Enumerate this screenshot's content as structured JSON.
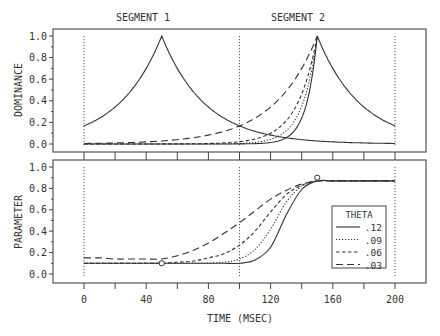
{
  "chart_data": [
    {
      "type": "line",
      "panel": "top",
      "title": "",
      "segment_labels": [
        "SEGMENT 1",
        "SEGMENT 2"
      ],
      "xlabel": "TIME (MSEC)",
      "ylabel": "DOMINANCE",
      "xlim": [
        -20,
        220
      ],
      "ylim": [
        0.0,
        1.0
      ],
      "yticks": [
        "0.0",
        "0.2",
        "0.4",
        "0.6",
        "0.8",
        "1.0"
      ],
      "vlines": [
        0,
        100,
        200
      ],
      "grid": false,
      "x": [
        0,
        10,
        20,
        30,
        40,
        50,
        60,
        70,
        80,
        90,
        100,
        110,
        120,
        130,
        140,
        150,
        160,
        170,
        180,
        190,
        200
      ],
      "series": [
        {
          "name": "Segment 1 dominance",
          "style": "solid",
          "values": [
            0.17,
            0.24,
            0.34,
            0.48,
            0.7,
            1.0,
            0.7,
            0.48,
            0.34,
            0.24,
            0.17,
            0.12,
            0.09,
            0.07,
            0.05,
            0.04,
            0.03,
            0.02,
            0.02,
            0.01,
            0.01
          ]
        },
        {
          "name": "Segment 2 dominance, theta .12",
          "style": "solid",
          "values": [
            0.0,
            0.0,
            0.0,
            0.0,
            0.0,
            0.0,
            0.0,
            0.0,
            0.0,
            0.0,
            0.0,
            0.01,
            0.02,
            0.07,
            0.25,
            1.0,
            0.7,
            0.48,
            0.34,
            0.24,
            0.17
          ]
        },
        {
          "name": "Segment 2 dominance, theta .09",
          "style": "dotted",
          "values": [
            0.0,
            0.0,
            0.0,
            0.0,
            0.0,
            0.0,
            0.0,
            0.0,
            0.0,
            0.01,
            0.01,
            0.02,
            0.05,
            0.12,
            0.33,
            1.0
          ]
        },
        {
          "name": "Segment 2 dominance, theta .06",
          "style": "dashed",
          "values": [
            0.0,
            0.0,
            0.0,
            0.0,
            0.01,
            0.01,
            0.01,
            0.02,
            0.03,
            0.04,
            0.06,
            0.09,
            0.14,
            0.24,
            0.44,
            1.0
          ]
        },
        {
          "name": "Segment 2 dominance, theta .03",
          "style": "longdash",
          "values": [
            0.03,
            0.03,
            0.04,
            0.05,
            0.06,
            0.07,
            0.09,
            0.11,
            0.13,
            0.17,
            0.22,
            0.28,
            0.37,
            0.5,
            0.68,
            1.0
          ]
        }
      ]
    },
    {
      "type": "line",
      "panel": "bottom",
      "xlabel": "TIME (MSEC)",
      "ylabel": "PARAMETER",
      "xlim": [
        -20,
        220
      ],
      "ylim": [
        0.0,
        1.0
      ],
      "xticks": [
        "0",
        "40",
        "80",
        "120",
        "160",
        "200"
      ],
      "yticks": [
        "0.0",
        "0.2",
        "0.4",
        "0.6",
        "0.8",
        "1.0"
      ],
      "vlines": [
        0,
        100,
        200
      ],
      "grid": false,
      "targets": [
        {
          "x": 50,
          "y": 0.1
        },
        {
          "x": 150,
          "y": 0.9
        }
      ],
      "legend": {
        "title": "THETA",
        "position": "lower right",
        "entries": [
          {
            "label": ".12",
            "style": "solid"
          },
          {
            "label": ".09",
            "style": "dotted"
          },
          {
            "label": ".06",
            "style": "dashed"
          },
          {
            "label": ".03",
            "style": "longdash"
          }
        ]
      },
      "x": [
        0,
        10,
        20,
        30,
        40,
        50,
        60,
        70,
        80,
        90,
        100,
        110,
        120,
        130,
        140,
        150,
        160,
        170,
        180,
        190,
        200
      ],
      "series": [
        {
          "name": ".12",
          "style": "solid",
          "values": [
            0.1,
            0.1,
            0.1,
            0.1,
            0.1,
            0.1,
            0.1,
            0.1,
            0.1,
            0.1,
            0.1,
            0.13,
            0.25,
            0.55,
            0.79,
            0.87,
            0.87,
            0.87,
            0.87,
            0.87,
            0.87
          ]
        },
        {
          "name": ".09",
          "style": "dotted",
          "values": [
            0.1,
            0.1,
            0.1,
            0.1,
            0.1,
            0.1,
            0.1,
            0.1,
            0.1,
            0.11,
            0.14,
            0.23,
            0.42,
            0.67,
            0.82,
            0.87,
            0.87,
            0.87,
            0.87,
            0.87,
            0.87
          ]
        },
        {
          "name": ".06",
          "style": "dashed",
          "values": [
            0.1,
            0.1,
            0.1,
            0.1,
            0.1,
            0.1,
            0.11,
            0.12,
            0.15,
            0.19,
            0.27,
            0.4,
            0.58,
            0.74,
            0.83,
            0.87,
            0.87,
            0.87,
            0.87,
            0.87,
            0.87
          ]
        },
        {
          "name": ".03",
          "style": "longdash",
          "values": [
            0.15,
            0.15,
            0.14,
            0.14,
            0.14,
            0.14,
            0.17,
            0.22,
            0.29,
            0.38,
            0.48,
            0.59,
            0.7,
            0.78,
            0.84,
            0.87,
            0.87,
            0.87,
            0.87,
            0.87,
            0.87
          ]
        }
      ]
    }
  ],
  "labels": {
    "segment1": "SEGMENT 1",
    "segment2": "SEGMENT 2",
    "top_ylabel": "DOMINANCE",
    "bottom_ylabel": "PARAMETER",
    "xlabel": "TIME (MSEC)",
    "legend_title": "THETA"
  }
}
